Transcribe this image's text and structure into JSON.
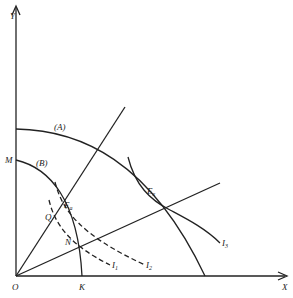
{
  "diagram": {
    "axes": {
      "x_label": "X",
      "y_label": "Y",
      "origin_label": "O"
    },
    "curves": {
      "ppf_a_label": "(A)",
      "ppf_b_label": "(B)",
      "i1_label": "I",
      "i1_sub": "1",
      "i2_label": "I",
      "i2_sub": "2",
      "i3_label": "I",
      "i3_sub": "3"
    },
    "points": {
      "m_label": "M",
      "k_label": "K",
      "q_label": "Q",
      "n_label": "N",
      "ea_label": "E",
      "ea_sub": "a",
      "ex_label": "E",
      "ex_sub": "x"
    },
    "colors": {
      "stroke": "#222222",
      "background": "#ffffff"
    }
  }
}
